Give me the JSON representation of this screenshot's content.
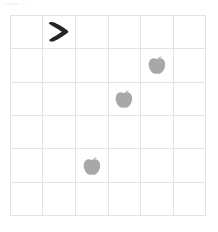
{
  "canvas": {
    "width": 218,
    "height": 232,
    "background": "#ffffff"
  },
  "watermark": {
    "text": "▪ ▬▬ ▪▪"
  },
  "grid": {
    "columns": 6,
    "rows": 6,
    "line_color": "#e3e3e3",
    "border_color": "#e0e0e0",
    "x": 10,
    "y": 15,
    "width": 196,
    "height": 201,
    "cell_width": 32.7,
    "cell_height": 33.5
  },
  "objects": [
    {
      "name": "arrow-marker",
      "icon": "chevron-right-icon",
      "label": ">",
      "color": "#222222",
      "row": 1,
      "col": 2
    },
    {
      "name": "apple",
      "icon": "apple-icon",
      "label": "apple",
      "color": "#a8a8a8",
      "stem_color": "#c9c9c9",
      "row": 2,
      "col": 5
    },
    {
      "name": "apple",
      "icon": "apple-icon",
      "label": "apple",
      "color": "#a8a8a8",
      "stem_color": "#c9c9c9",
      "row": 3,
      "col": 4
    },
    {
      "name": "apple",
      "icon": "apple-icon",
      "label": "apple",
      "color": "#a8a8a8",
      "stem_color": "#c9c9c9",
      "row": 5,
      "col": 3
    }
  ],
  "counts": {
    "apples": 3,
    "arrows": 1
  }
}
